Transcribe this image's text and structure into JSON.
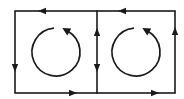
{
  "diagram": {
    "stroke_color": "#1a1a1a",
    "background": "#ffffff",
    "outer_rect": {
      "x1": 15,
      "y1": 11,
      "x2": 175,
      "y2": 93
    },
    "divider_x": 97,
    "edge_arrows": [
      {
        "id": "top-left",
        "x": 42,
        "y": 11,
        "direction": "left"
      },
      {
        "id": "top-right",
        "x": 122,
        "y": 11,
        "direction": "left"
      },
      {
        "id": "bottom-left",
        "x": 73,
        "y": 93,
        "direction": "right"
      },
      {
        "id": "bottom-right",
        "x": 155,
        "y": 93,
        "direction": "right"
      },
      {
        "id": "left-edge",
        "x": 15,
        "y": 68,
        "direction": "down"
      },
      {
        "id": "right-edge",
        "x": 175,
        "y": 31,
        "direction": "up"
      },
      {
        "id": "middle-up",
        "x": 97,
        "y": 32,
        "direction": "up"
      },
      {
        "id": "middle-down",
        "x": 97,
        "y": 68,
        "direction": "down"
      }
    ],
    "circulation_arrows": [
      {
        "id": "left-loop",
        "cx": 56,
        "cy": 52,
        "r": 24,
        "direction": "counterclockwise"
      },
      {
        "id": "right-loop",
        "cx": 136,
        "cy": 52,
        "r": 24,
        "direction": "counterclockwise"
      }
    ]
  }
}
